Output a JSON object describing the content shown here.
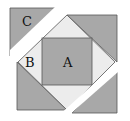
{
  "diagram": {
    "type": "geometric-figure",
    "labels": {
      "A": "A",
      "B": "B",
      "C": "C"
    },
    "colors": {
      "dark": "#a8a8a8",
      "light": "#ececec",
      "stroke": "#555555",
      "background": "#ffffff"
    }
  }
}
